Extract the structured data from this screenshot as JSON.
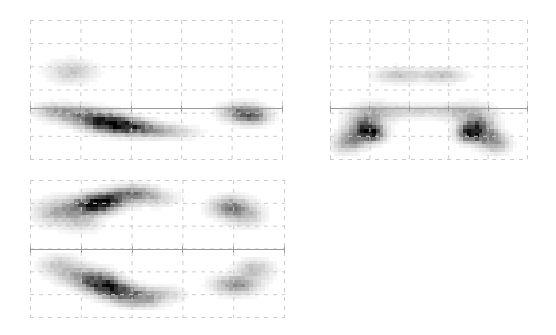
{
  "figure": {
    "width": 556,
    "height": 335,
    "background": "#ffffff"
  },
  "chart_data": [
    {
      "id": "panel-top-left",
      "type": "heatmap",
      "title": "",
      "xlabel": "",
      "ylabel": "",
      "position": {
        "x": 30,
        "y": 20,
        "width": 253,
        "height": 140
      },
      "grid": {
        "visible": true,
        "style": "dashed",
        "color": "#cccccc",
        "cols": 5,
        "rows": 6
      },
      "axis_line": {
        "visible": true,
        "orientation": "horizontal",
        "position_fraction": 0.63,
        "color": "#9a9a9a"
      },
      "xlim": [
        -1,
        1
      ],
      "ylim": [
        -1,
        1
      ],
      "colormap": "grayscale",
      "colormap_low": "#ffffff",
      "colormap_high": "#000000",
      "nx": 64,
      "ny": 36,
      "blobs": [
        {
          "cx": 0.165,
          "cy": 0.37,
          "sx": 0.055,
          "sy": 0.048,
          "rot": 0.0,
          "amp": 0.22
        },
        {
          "cx": 0.205,
          "cy": 0.685,
          "sx": 0.075,
          "sy": 0.04,
          "rot": 0.22,
          "amp": 0.55
        },
        {
          "cx": 0.3,
          "cy": 0.735,
          "sx": 0.055,
          "sy": 0.038,
          "rot": 0.22,
          "amp": 1.0
        },
        {
          "cx": 0.38,
          "cy": 0.76,
          "sx": 0.05,
          "sy": 0.035,
          "rot": 0.22,
          "amp": 0.92
        },
        {
          "cx": 0.47,
          "cy": 0.78,
          "sx": 0.06,
          "sy": 0.032,
          "rot": 0.18,
          "amp": 0.4
        },
        {
          "cx": 0.57,
          "cy": 0.795,
          "sx": 0.06,
          "sy": 0.028,
          "rot": 0.1,
          "amp": 0.16
        },
        {
          "cx": 0.09,
          "cy": 0.65,
          "sx": 0.045,
          "sy": 0.032,
          "rot": 0.1,
          "amp": 0.22
        },
        {
          "cx": 0.84,
          "cy": 0.66,
          "sx": 0.048,
          "sy": 0.038,
          "rot": 0.0,
          "amp": 0.6
        },
        {
          "cx": 0.88,
          "cy": 0.69,
          "sx": 0.04,
          "sy": 0.035,
          "rot": 0.0,
          "amp": 0.45
        }
      ]
    },
    {
      "id": "panel-top-right",
      "type": "heatmap",
      "title": "",
      "xlabel": "",
      "ylabel": "",
      "position": {
        "x": 330,
        "y": 20,
        "width": 198,
        "height": 140
      },
      "grid": {
        "visible": true,
        "style": "dashed",
        "color": "#cccccc",
        "cols": 5,
        "rows": 6
      },
      "axis_line": {
        "visible": true,
        "orientation": "horizontal",
        "position_fraction": 0.63,
        "color": "#9a9a9a"
      },
      "xlim": [
        -1,
        1
      ],
      "ylim": [
        -1,
        1
      ],
      "colormap": "grayscale",
      "colormap_low": "#ffffff",
      "colormap_high": "#000000",
      "nx": 52,
      "ny": 36,
      "blobs": [
        {
          "cx": 0.345,
          "cy": 0.395,
          "sx": 0.07,
          "sy": 0.032,
          "rot": 0.0,
          "amp": 0.26
        },
        {
          "cx": 0.56,
          "cy": 0.395,
          "sx": 0.07,
          "sy": 0.032,
          "rot": 0.0,
          "amp": 0.26
        },
        {
          "cx": 0.23,
          "cy": 0.66,
          "sx": 0.075,
          "sy": 0.04,
          "rot": 0.0,
          "amp": 0.3
        },
        {
          "cx": 0.69,
          "cy": 0.66,
          "sx": 0.075,
          "sy": 0.04,
          "rot": 0.0,
          "amp": 0.3
        },
        {
          "cx": 0.175,
          "cy": 0.76,
          "sx": 0.045,
          "sy": 0.05,
          "rot": -0.5,
          "amp": 0.7
        },
        {
          "cx": 0.745,
          "cy": 0.76,
          "sx": 0.045,
          "sy": 0.05,
          "rot": 0.5,
          "amp": 0.7
        },
        {
          "cx": 0.21,
          "cy": 0.8,
          "sx": 0.038,
          "sy": 0.042,
          "rot": -0.5,
          "amp": 1.0
        },
        {
          "cx": 0.71,
          "cy": 0.8,
          "sx": 0.038,
          "sy": 0.042,
          "rot": 0.5,
          "amp": 1.0
        },
        {
          "cx": 0.125,
          "cy": 0.84,
          "sx": 0.045,
          "sy": 0.045,
          "rot": -0.5,
          "amp": 0.55
        },
        {
          "cx": 0.795,
          "cy": 0.84,
          "sx": 0.045,
          "sy": 0.045,
          "rot": 0.5,
          "amp": 0.55
        },
        {
          "cx": 0.075,
          "cy": 0.89,
          "sx": 0.04,
          "sy": 0.04,
          "rot": 0.0,
          "amp": 0.26
        },
        {
          "cx": 0.845,
          "cy": 0.89,
          "sx": 0.04,
          "sy": 0.04,
          "rot": 0.0,
          "amp": 0.26
        },
        {
          "cx": 0.45,
          "cy": 0.65,
          "sx": 0.12,
          "sy": 0.03,
          "rot": 0.0,
          "amp": 0.18
        }
      ]
    },
    {
      "id": "panel-bottom-left",
      "type": "heatmap",
      "title": "",
      "xlabel": "",
      "ylabel": "",
      "position": {
        "x": 30,
        "y": 180,
        "width": 255,
        "height": 138
      },
      "grid": {
        "visible": true,
        "style": "dashed",
        "color": "#cccccc",
        "cols": 5,
        "rows": 6
      },
      "axis_line": {
        "visible": true,
        "orientation": "horizontal",
        "position_fraction": 0.5,
        "color": "#9a9a9a"
      },
      "xlim": [
        -1,
        1
      ],
      "ylim": [
        -1,
        1
      ],
      "colormap": "grayscale",
      "colormap_low": "#ffffff",
      "colormap_high": "#000000",
      "nx": 64,
      "ny": 36,
      "blobs": [
        {
          "cx": 0.1,
          "cy": 0.235,
          "sx": 0.05,
          "sy": 0.055,
          "rot": 0.0,
          "amp": 0.3
        },
        {
          "cx": 0.18,
          "cy": 0.2,
          "sx": 0.048,
          "sy": 0.045,
          "rot": 0.0,
          "amp": 0.42
        },
        {
          "cx": 0.245,
          "cy": 0.18,
          "sx": 0.042,
          "sy": 0.042,
          "rot": 0.0,
          "amp": 0.85
        },
        {
          "cx": 0.29,
          "cy": 0.16,
          "sx": 0.038,
          "sy": 0.038,
          "rot": 0.0,
          "amp": 1.0
        },
        {
          "cx": 0.35,
          "cy": 0.12,
          "sx": 0.045,
          "sy": 0.04,
          "rot": 0.0,
          "amp": 0.6
        },
        {
          "cx": 0.42,
          "cy": 0.095,
          "sx": 0.045,
          "sy": 0.035,
          "rot": 0.0,
          "amp": 0.45
        },
        {
          "cx": 0.49,
          "cy": 0.13,
          "sx": 0.05,
          "sy": 0.035,
          "rot": 0.0,
          "amp": 0.22
        },
        {
          "cx": 0.2,
          "cy": 0.3,
          "sx": 0.045,
          "sy": 0.04,
          "rot": 0.0,
          "amp": 0.22
        },
        {
          "cx": 0.79,
          "cy": 0.2,
          "sx": 0.045,
          "sy": 0.045,
          "rot": 0.0,
          "amp": 0.6
        },
        {
          "cx": 0.845,
          "cy": 0.255,
          "sx": 0.042,
          "sy": 0.048,
          "rot": 0.0,
          "amp": 0.28
        },
        {
          "cx": 0.19,
          "cy": 0.69,
          "sx": 0.05,
          "sy": 0.045,
          "rot": 0.0,
          "amp": 0.35
        },
        {
          "cx": 0.26,
          "cy": 0.735,
          "sx": 0.045,
          "sy": 0.042,
          "rot": 0.0,
          "amp": 0.9
        },
        {
          "cx": 0.31,
          "cy": 0.78,
          "sx": 0.04,
          "sy": 0.04,
          "rot": 0.0,
          "amp": 1.0
        },
        {
          "cx": 0.375,
          "cy": 0.825,
          "sx": 0.045,
          "sy": 0.04,
          "rot": 0.0,
          "amp": 0.7
        },
        {
          "cx": 0.44,
          "cy": 0.86,
          "sx": 0.045,
          "sy": 0.038,
          "rot": 0.0,
          "amp": 0.4
        },
        {
          "cx": 0.52,
          "cy": 0.83,
          "sx": 0.05,
          "sy": 0.035,
          "rot": 0.0,
          "amp": 0.2
        },
        {
          "cx": 0.115,
          "cy": 0.62,
          "sx": 0.045,
          "sy": 0.045,
          "rot": 0.0,
          "amp": 0.25
        },
        {
          "cx": 0.81,
          "cy": 0.76,
          "sx": 0.05,
          "sy": 0.04,
          "rot": 0.0,
          "amp": 0.55
        },
        {
          "cx": 0.88,
          "cy": 0.65,
          "sx": 0.042,
          "sy": 0.045,
          "rot": 0.0,
          "amp": 0.28
        }
      ]
    }
  ]
}
